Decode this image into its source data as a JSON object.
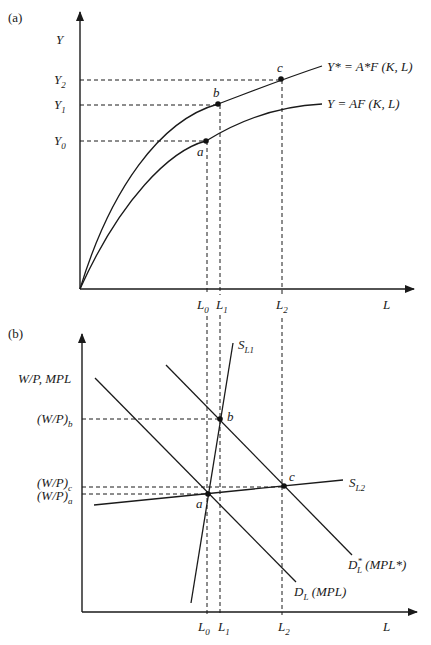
{
  "panel_a": {
    "tag": "(a)",
    "y_axis_label": "Y",
    "x_axis_label": "L",
    "y_ticks": [
      {
        "main": "Y",
        "sub": "2"
      },
      {
        "main": "Y",
        "sub": "1"
      },
      {
        "main": "Y",
        "sub": "0"
      }
    ],
    "x_ticks": [
      {
        "main": "L",
        "sub": "0"
      },
      {
        "main": "L",
        "sub": "1"
      },
      {
        "main": "L",
        "sub": "2"
      }
    ],
    "curve_upper_label": "Y* = A*F (K, L)",
    "curve_lower_label": "Y = AF (K, L)",
    "points": {
      "a": "a",
      "b": "b",
      "c": "c"
    }
  },
  "panel_b": {
    "tag": "(b)",
    "y_axis_label": "W/P, MPL",
    "x_axis_label": "L",
    "y_ticks": [
      {
        "main": "(W/P)",
        "sub": "b"
      },
      {
        "main": "(W/P)",
        "sub": "c"
      },
      {
        "main": "(W/P)",
        "sub": "a"
      }
    ],
    "x_ticks": [
      {
        "main": "L",
        "sub": "0"
      },
      {
        "main": "L",
        "sub": "1"
      },
      {
        "main": "L",
        "sub": "2"
      }
    ],
    "supply1": {
      "main": "S",
      "sub": "L1"
    },
    "supply2": {
      "main": "S",
      "sub": "L2"
    },
    "demand": {
      "main": "D",
      "sub": "L",
      "suffix": " (MPL)"
    },
    "demand_star": {
      "main": "D",
      "sub": "L",
      "sup": "*",
      "suffix": " (MPL*)"
    },
    "points": {
      "a": "a",
      "b": "b",
      "c": "c"
    }
  },
  "colors": {
    "ink": "#1a1a1a",
    "background": "#ffffff"
  }
}
